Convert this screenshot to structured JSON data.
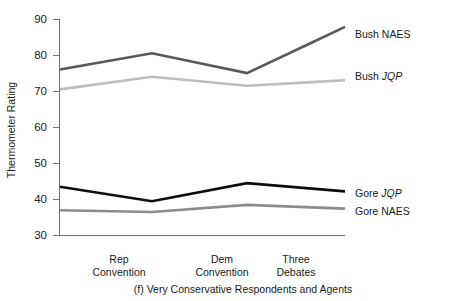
{
  "chart_data": {
    "type": "line",
    "title": "",
    "caption": "(f) Very Conservative Respondents and Agents",
    "xlabel": "",
    "ylabel": "Thermometer Rating",
    "ylim": [
      30,
      90
    ],
    "yticks": [
      30,
      40,
      50,
      60,
      70,
      80,
      90
    ],
    "ytick_labels": [
      "30",
      "40",
      "50",
      "60",
      "70",
      "80",
      "90"
    ],
    "grid": false,
    "legend_position": "right-inline",
    "x": [
      0,
      1,
      2,
      3
    ],
    "categories": [
      "",
      "Rep Convention",
      "Dem Convention",
      "Three Debates"
    ],
    "xtick_labels": [
      {
        "line1": "Rep",
        "line2": "Convention"
      },
      {
        "line1": "Dem",
        "line2": "Convention"
      },
      {
        "line1": "Three",
        "line2": "Debates"
      }
    ],
    "series": [
      {
        "name": "Bush NAES",
        "label_plain": "Bush ",
        "label_italic": "NAES",
        "label_italic_is_italic": false,
        "color": "#595959",
        "width": 2.6,
        "values": [
          76.0,
          80.5,
          75.0,
          83.5
        ]
      },
      {
        "name": "Bush JQP",
        "label_plain": "Bush ",
        "label_italic": "JQP",
        "label_italic_is_italic": true,
        "color": "#bdbdbd",
        "width": 2.6,
        "values": [
          70.5,
          74.0,
          71.5,
          72.5
        ]
      },
      {
        "name": "Gore JQP",
        "label_plain": "Gore ",
        "label_italic": "JQP",
        "label_italic_is_italic": true,
        "color": "#0d0d0d",
        "width": 2.6,
        "values": [
          43.5,
          39.5,
          44.5,
          43.0
        ]
      },
      {
        "name": "Gore NAES",
        "label_plain": "Gore ",
        "label_italic": "NAES",
        "label_italic_is_italic": false,
        "color": "#8c8c8c",
        "width": 2.6,
        "values": [
          37.0,
          36.5,
          38.5,
          37.8
        ]
      }
    ]
  },
  "axis": {
    "y_title": "Thermometer Rating"
  },
  "labels": {
    "bush_naes_plain": "Bush ",
    "bush_naes_em": "NAES",
    "bush_jqp_plain": "Bush ",
    "bush_jqp_em": "JQP",
    "gore_jqp_plain": "Gore ",
    "gore_jqp_em": "JQP",
    "gore_naes_plain": "Gore ",
    "gore_naes_em": "NAES"
  },
  "ticks": {
    "y0": "30",
    "y1": "40",
    "y2": "50",
    "y3": "60",
    "y4": "70",
    "y5": "80",
    "y6": "90",
    "x0_l1": "Rep",
    "x0_l2": "Convention",
    "x1_l1": "Dem",
    "x1_l2": "Convention",
    "x2_l1": "Three",
    "x2_l2": "Debates"
  },
  "caption": {
    "text": "(f) Very Conservative Respondents and Agents"
  }
}
